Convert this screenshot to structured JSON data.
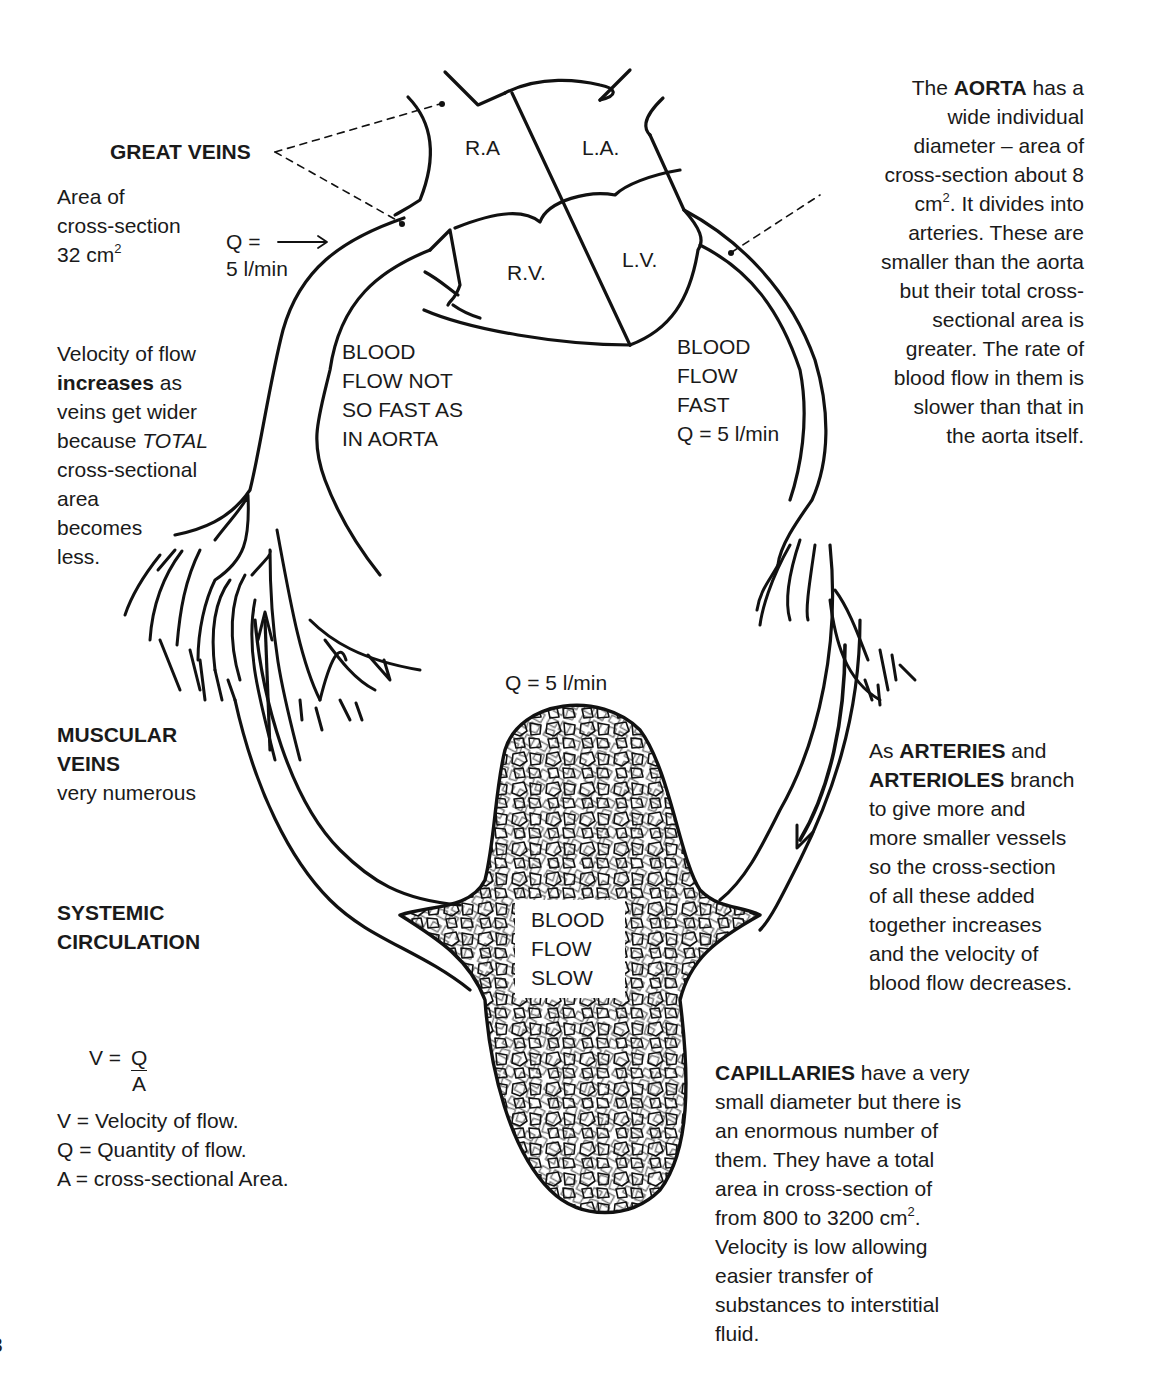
{
  "diagram": {
    "type": "systemic circulation schematic",
    "heart": {
      "chambers": [
        "R.A",
        "L.A.",
        "R.V.",
        "L.V."
      ]
    },
    "great_veins": {
      "title": "GREAT VEINS",
      "area_line1": "Area of",
      "area_line2": "cross-section",
      "area_line3_value": "32 cm",
      "area_line3_sup": "2",
      "flow_q_label": "Q =",
      "flow_q_value": "5 l/min"
    },
    "aorta_note": {
      "l1_pre": "The ",
      "l1_bold": "AORTA",
      "l1_post": " has a",
      "l2": "wide individual",
      "l3": "diameter – area of",
      "l4": "cross-section about 8",
      "l5_pre": "cm",
      "l5_sup": "2",
      "l5_post": ". It divides into",
      "l6": "arteries. These are",
      "l7": "smaller than the aorta",
      "l8": "but their total cross-",
      "l9": "sectional area is",
      "l10": "greater. The rate of",
      "l11": "blood flow in them is",
      "l12": "slower than that in",
      "l13": "the aorta itself."
    },
    "vein_velocity_note": {
      "l1": "Velocity of flow",
      "l2_bold": "increases",
      "l2_post": " as",
      "l3": "veins get wider",
      "l4_pre": "because ",
      "l4_italic": "TOTAL",
      "l5": "cross-sectional",
      "l6": "area",
      "l7": "becomes",
      "l8": "less."
    },
    "venous_side_flow": {
      "l1": "BLOOD",
      "l2": "FLOW NOT",
      "l3": "SO FAST AS",
      "l4": "IN AORTA"
    },
    "arterial_side_flow": {
      "l1": "BLOOD",
      "l2": "FLOW",
      "l3": "FAST",
      "l4": "Q = 5 l/min"
    },
    "capillary_inflow": "Q = 5 l/min",
    "capillary_flow": {
      "l1": "BLOOD",
      "l2": "FLOW",
      "l3": "SLOW"
    },
    "muscular_veins": {
      "l1": "MUSCULAR",
      "l2": "VEINS",
      "l3": "very numerous"
    },
    "systemic": {
      "l1": "SYSTEMIC",
      "l2": "CIRCULATION"
    },
    "formula": {
      "lhs": "V =",
      "numerator": "Q",
      "denominator": "A",
      "legend": [
        "V = Velocity of flow.",
        "Q = Quantity of flow.",
        "A = cross-sectional Area."
      ]
    },
    "arteries_note": {
      "l1_pre": "As ",
      "l1_bold": "ARTERIES",
      "l1_post": " and",
      "l2_bold": "ARTERIOLES",
      "l2_post": " branch",
      "l3": "to give more and",
      "l4": "more smaller vessels",
      "l5": "so the cross-section",
      "l6": "of all these added",
      "l7": "together increases",
      "l8": "and the velocity of",
      "l9": "blood flow decreases."
    },
    "capillaries_note": {
      "l1_bold": "CAPILLARIES",
      "l1_post": " have a very",
      "l2": "small diameter but there is",
      "l3": "an enormous number of",
      "l4": "them. They have a total",
      "l5": "area in cross-section of",
      "l6_pre": "from 800 to 3200 cm",
      "l6_sup": "2",
      "l6_post": ".",
      "l7": "Velocity is low allowing",
      "l8": "easier transfer of",
      "l9": "substances to interstitial",
      "l10": "fluid."
    },
    "page_number_fragment": "3"
  }
}
